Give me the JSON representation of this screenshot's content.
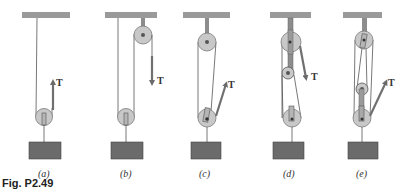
{
  "figure": {
    "caption": "Fig. P2.49",
    "colors": {
      "ceiling": "#9a9a9a",
      "block": "#6b6b6b",
      "pulley": "#c8c8c8",
      "pulley_edge": "#7a7a7a",
      "rope": "#555555",
      "arrow": "#707070",
      "strap": "#8d8d8d"
    },
    "panels": [
      {
        "id": "a",
        "label": "(a)",
        "force_label": "T",
        "description": "single movable pulley, tension pulled upward"
      },
      {
        "id": "b",
        "label": "(b)",
        "force_label": "T",
        "description": "fixed pulley plus movable pulley, tension pulled downward"
      },
      {
        "id": "c",
        "label": "(c)",
        "force_label": "T",
        "description": "fixed and movable pulley, tension pulled upward at angle"
      },
      {
        "id": "d",
        "label": "(d)",
        "force_label": "T",
        "description": "three pulleys, tension pulled downward at angle"
      },
      {
        "id": "e",
        "label": "(e)",
        "force_label": "T",
        "description": "three pulleys, tension pulled upward at angle"
      }
    ]
  }
}
